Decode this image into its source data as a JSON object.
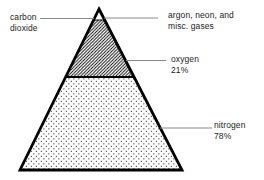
{
  "background": "#ffffff",
  "colors": {
    "outline": "#000000",
    "leader_line": "#8a8a8a",
    "text": "#1c1c1c",
    "hatch_stroke": "#000000",
    "dot_fill": "#3a3a3a"
  },
  "labels": {
    "carbon_dioxide": {
      "line1": "carbon",
      "line2": "dioxide"
    },
    "argon": {
      "line1": "argon, neon, and",
      "line2": "misc. gases"
    },
    "oxygen": {
      "line1": "oxygen",
      "line2": "21%"
    },
    "nitrogen": {
      "line1": "nitrogen",
      "line2": "78%"
    }
  },
  "sections": [
    {
      "name": "carbon dioxide / argon, neon, and misc. gases",
      "fill": "plain-white",
      "position": "apex"
    },
    {
      "name": "oxygen",
      "value": "21%",
      "fill": "diagonal-hatch",
      "position": "middle"
    },
    {
      "name": "nitrogen",
      "value": "78%",
      "fill": "dotted",
      "position": "base"
    }
  ]
}
